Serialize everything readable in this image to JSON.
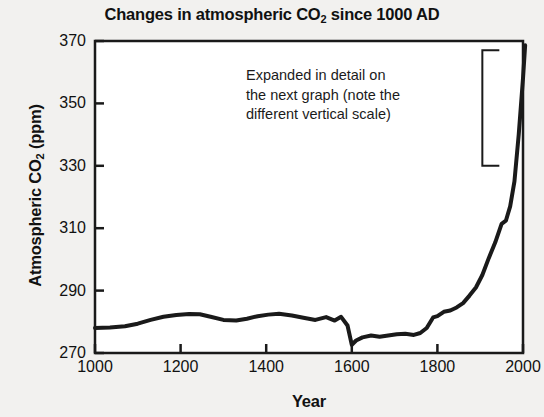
{
  "chart_data": {
    "type": "line",
    "title": "Changes in atmospheric CO2 since 1000 AD",
    "title_parts": {
      "before": "Changes in atmospheric CO",
      "sub": "2",
      "after": " since 1000 AD"
    },
    "xlabel": "Year",
    "ylabel": "Atmospheric CO2 (ppm)",
    "ylabel_parts": {
      "before": "Atmospheric CO",
      "sub": "2",
      "after": " (ppm)"
    },
    "xlim": [
      1000,
      2000
    ],
    "ylim": [
      270,
      370
    ],
    "xticks": [
      1000,
      1200,
      1400,
      1600,
      1800,
      2000
    ],
    "yticks": [
      270,
      290,
      310,
      330,
      350,
      370
    ],
    "grid": false,
    "legend": null,
    "line_color": "#1a1a1a",
    "line_width": 4,
    "series": [
      {
        "name": "Atmospheric CO2",
        "x": [
          1000,
          1035,
          1070,
          1100,
          1130,
          1160,
          1190,
          1220,
          1245,
          1270,
          1300,
          1330,
          1355,
          1380,
          1405,
          1430,
          1460,
          1490,
          1515,
          1540,
          1560,
          1575,
          1590,
          1600,
          1610,
          1625,
          1645,
          1665,
          1685,
          1705,
          1725,
          1745,
          1760,
          1775,
          1790,
          1800,
          1815,
          1830,
          1845,
          1860,
          1875,
          1890,
          1905,
          1920,
          1935,
          1950,
          1960,
          1970,
          1980,
          1990,
          2000,
          2005
        ],
        "y": [
          278.0,
          278.2,
          278.6,
          279.4,
          280.6,
          281.6,
          282.2,
          282.5,
          282.4,
          281.6,
          280.6,
          280.4,
          281.0,
          281.8,
          282.3,
          282.6,
          282.0,
          281.2,
          280.6,
          281.5,
          280.4,
          281.6,
          278.8,
          272.6,
          274.0,
          275.0,
          275.6,
          275.2,
          275.6,
          276.0,
          276.2,
          275.8,
          276.4,
          278.0,
          281.4,
          281.8,
          283.2,
          283.6,
          284.6,
          286.0,
          288.4,
          291.0,
          295.0,
          300.4,
          305.4,
          311.4,
          312.4,
          317.0,
          325.0,
          340.0,
          358.0,
          368.6
        ]
      }
    ],
    "annotation": {
      "lines": [
        "Expanded in detail on",
        "the next graph (note the",
        "different vertical scale)"
      ],
      "bracket": {
        "x_year": 1905,
        "y_top": 367.0,
        "y_bottom": 330.0
      }
    }
  },
  "plot_geometry": {
    "left": 95,
    "right": 523,
    "top": 41,
    "bottom": 353
  }
}
